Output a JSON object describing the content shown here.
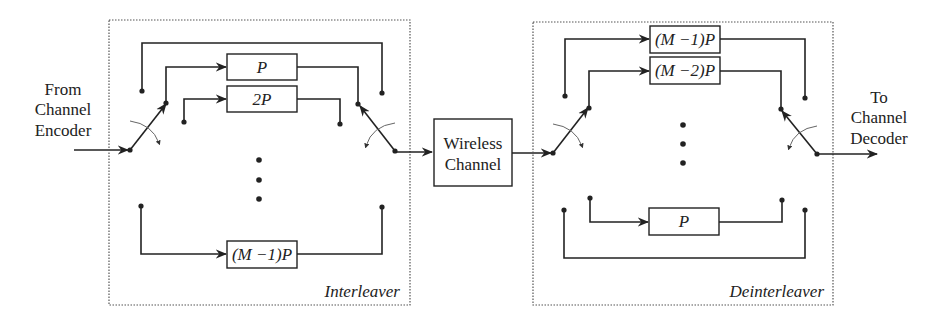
{
  "diagram": {
    "type": "block-diagram"
  },
  "labels": {
    "input": [
      "From",
      "Channel",
      "Encoder"
    ],
    "output": [
      "To",
      "Channel",
      "Decoder"
    ],
    "channel": [
      "Wireless",
      "Channel"
    ],
    "interleaver_title": "Interleaver",
    "deinterleaver_title": "Deinterleaver"
  },
  "interleaver": {
    "branches": [
      {
        "index": 0,
        "delay": ""
      },
      {
        "index": 1,
        "delay": "P"
      },
      {
        "index": 2,
        "delay": "2P"
      },
      {
        "index": 3,
        "delay": "(M −1)P"
      }
    ],
    "ellipsis": "⋮"
  },
  "deinterleaver": {
    "branches": [
      {
        "index": 0,
        "delay": "(M −1)P"
      },
      {
        "index": 1,
        "delay": "(M −2)P"
      },
      {
        "index": 2,
        "delay": "P"
      },
      {
        "index": 3,
        "delay": ""
      }
    ],
    "ellipsis": "⋮"
  },
  "colors": {
    "line": "#222222",
    "background": "#ffffff"
  }
}
